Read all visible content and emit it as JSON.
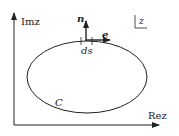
{
  "diagram": {
    "axes": {
      "y_label": "Imz",
      "x_label": "Rez"
    },
    "plane_label": "z",
    "curve_label": "C",
    "normal_vector_label": "n",
    "tangent_vector_label": "e",
    "arc_element_label": "ds",
    "colors": {
      "stroke": "#222222",
      "background": "#ffffff"
    }
  }
}
